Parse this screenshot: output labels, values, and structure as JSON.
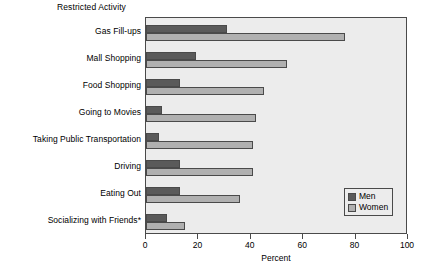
{
  "chart_data": {
    "type": "bar",
    "orientation": "horizontal",
    "title": "Restricted Activity",
    "xlabel": "Percent",
    "ylabel": "",
    "xlim": [
      0,
      100
    ],
    "xticks": [
      0,
      20,
      40,
      60,
      80,
      100
    ],
    "grid": false,
    "legend_position": "bottom-right",
    "categories": [
      "Gas Fill-ups",
      "Mall Shopping",
      "Food Shopping",
      "Going to Movies",
      "Taking Public Transportation",
      "Driving",
      "Eating Out",
      "Socializing with Friends*"
    ],
    "series": [
      {
        "name": "Men",
        "color": "#5a5a5a",
        "values": [
          31,
          19,
          13,
          6,
          5,
          13,
          13,
          8
        ]
      },
      {
        "name": "Women",
        "color": "#b0b0b0",
        "values": [
          76,
          54,
          45,
          42,
          41,
          41,
          36,
          15
        ]
      }
    ]
  },
  "colors": {
    "men": "#5a5a5a",
    "women": "#b0b0b0",
    "plot_background": "#ececec",
    "axis": "#4a4a4a",
    "page_background": "#ffffff"
  },
  "footnote": ""
}
